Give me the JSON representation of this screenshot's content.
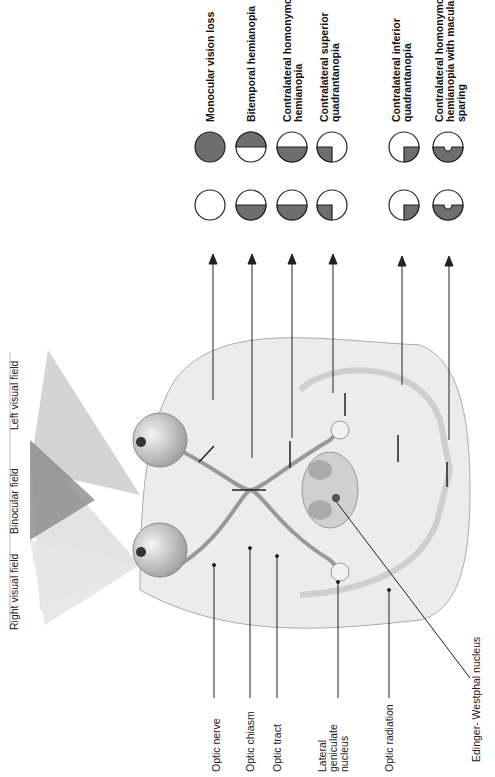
{
  "diagram": {
    "orientation": "rotated-90-ccw",
    "visual_fields": {
      "left": "Left visual field",
      "binocular": "Binocular field",
      "right": "Right visual field"
    },
    "structures": [
      {
        "id": "optic-nerve",
        "label": "Optic nerve"
      },
      {
        "id": "optic-chiasm",
        "label": "Optic chiasm"
      },
      {
        "id": "optic-tract",
        "label": "Optic tract"
      },
      {
        "id": "lgn",
        "label_lines": [
          "Lateral",
          "geniculate",
          "nucleus"
        ]
      },
      {
        "id": "optic-radiation",
        "label": "Optic radiation"
      },
      {
        "id": "edinger-westphal",
        "label": "Edinger- Westphal nucleus"
      }
    ],
    "deficits": [
      {
        "label_lines": [
          "Monocular vision loss"
        ],
        "left_eye": "full",
        "right_eye": "none"
      },
      {
        "label_lines": [
          "Bitemporal hemianopia"
        ],
        "left_eye": "top-half",
        "right_eye": "bottom-half"
      },
      {
        "label_lines": [
          "Contralateral homonymous",
          "hemianopia"
        ],
        "left_eye": "bottom-half",
        "right_eye": "bottom-half"
      },
      {
        "label_lines": [
          "Contralateral superior",
          "quadrantanopia"
        ],
        "left_eye": "bottom-left-quarter",
        "right_eye": "bottom-left-quarter"
      },
      {
        "label_lines": [
          "Contralateral inferior",
          "quadrantanopia"
        ],
        "left_eye": "bottom-right-quarter",
        "right_eye": "bottom-right-quarter"
      },
      {
        "label_lines": [
          "Contralateral homonymous",
          "hemianopia with macular",
          "sparing"
        ],
        "left_eye": "bottom-half-notch",
        "right_eye": "bottom-half-notch"
      }
    ],
    "colors": {
      "lesion_fill": "#6e6e6e",
      "outline": "#222222",
      "brain": "#e6e6e6"
    }
  }
}
